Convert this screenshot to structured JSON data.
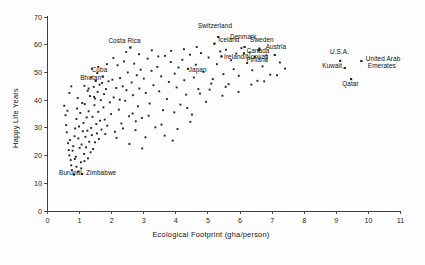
{
  "chart_data": {
    "type": "scatter",
    "title": "",
    "xlabel": "Ecological Footprint (gha/person)",
    "ylabel": "Happy Life Years",
    "xlim": [
      0,
      11
    ],
    "ylim": [
      0,
      70
    ],
    "xticks": [
      0,
      1,
      2,
      3,
      4,
      5,
      6,
      7,
      8,
      9,
      10,
      11
    ],
    "yticks": [
      0,
      10,
      20,
      30,
      40,
      50,
      60,
      70
    ],
    "grid": false,
    "legend": "none",
    "marker_color": "#232323",
    "axis_color": "#2b2b2b",
    "background_color": "#fdfdfd",
    "annotations": [
      {
        "label": "Costa Rica",
        "x": 2.58,
        "y": 59.0,
        "lx": 2.4,
        "ly": 60.6,
        "anchor": "middle"
      },
      {
        "label": "Cuba",
        "x": 1.72,
        "y": 48.5,
        "lx": 1.62,
        "ly": 50.1,
        "anchor": "middle"
      },
      {
        "label": "Bhutan",
        "x": 1.5,
        "y": 47.0,
        "lx": 1.02,
        "ly": 47.3,
        "anchor": "start"
      },
      {
        "label": "Burundi",
        "x": 0.82,
        "y": 13.2,
        "lx": 0.36,
        "ly": 12.9,
        "anchor": "start"
      },
      {
        "label": "Zimbabwe",
        "x": 1.08,
        "y": 13.4,
        "lx": 1.2,
        "ly": 12.9,
        "anchor": "start"
      },
      {
        "label": "Japan",
        "x": 4.38,
        "y": 51.3,
        "lx": 4.4,
        "ly": 50.3,
        "anchor": "start"
      },
      {
        "label": "Switzerland",
        "x": 5.32,
        "y": 62.8,
        "lx": 5.22,
        "ly": 65.9,
        "anchor": "middle"
      },
      {
        "label": "Iceland",
        "x": 5.2,
        "y": 60.4,
        "lx": 5.32,
        "ly": 60.8,
        "anchor": "start"
      },
      {
        "label": "Denmark",
        "x": 6.14,
        "y": 59.2,
        "lx": 6.1,
        "ly": 61.9,
        "anchor": "middle"
      },
      {
        "label": "Sweden",
        "x": 6.6,
        "y": 58.6,
        "lx": 6.68,
        "ly": 61.0,
        "anchor": "middle"
      },
      {
        "label": "Austria",
        "x": 7.08,
        "y": 56.3,
        "lx": 7.12,
        "ly": 58.6,
        "anchor": "middle"
      },
      {
        "label": "Canada",
        "x": 6.12,
        "y": 56.9,
        "lx": 6.2,
        "ly": 57.0,
        "anchor": "start"
      },
      {
        "label": "Finland",
        "x": 6.58,
        "y": 58.0,
        "lx": 6.54,
        "ly": 53.6,
        "anchor": "middle"
      },
      {
        "label": "Ireland/Norway",
        "x": 5.42,
        "y": 55.8,
        "lx": 5.5,
        "ly": 55.0,
        "anchor": "start"
      },
      {
        "label": "U.S.A.",
        "x": 9.12,
        "y": 54.2,
        "lx": 9.1,
        "ly": 56.8,
        "anchor": "middle"
      },
      {
        "label": "Kuwait",
        "x": 9.26,
        "y": 51.6,
        "lx": 9.18,
        "ly": 51.6,
        "anchor": "end"
      },
      {
        "label": "United Arab",
        "x": 9.78,
        "y": 54.1,
        "lx": 9.92,
        "ly": 54.2,
        "anchor": "start"
      },
      {
        "label": "Emerates",
        "x": null,
        "y": null,
        "lx": 9.98,
        "ly": 51.6,
        "anchor": "start"
      },
      {
        "label": "Qatar",
        "x": 9.46,
        "y": 47.6,
        "lx": 9.44,
        "ly": 45.2,
        "anchor": "middle"
      }
    ],
    "points": [
      [
        0.52,
        38.0
      ],
      [
        0.56,
        34.6
      ],
      [
        0.58,
        31.0
      ],
      [
        0.6,
        28.4
      ],
      [
        0.62,
        36.2
      ],
      [
        0.64,
        24.5
      ],
      [
        0.66,
        22.0
      ],
      [
        0.68,
        20.1
      ],
      [
        0.7,
        25.6
      ],
      [
        0.72,
        18.4
      ],
      [
        0.74,
        16.5
      ],
      [
        0.76,
        14.8
      ],
      [
        0.78,
        21.8
      ],
      [
        0.8,
        23.4
      ],
      [
        0.82,
        13.2
      ],
      [
        0.84,
        27.0
      ],
      [
        0.86,
        29.8
      ],
      [
        0.88,
        19.6
      ],
      [
        0.9,
        33.2
      ],
      [
        0.92,
        37.0
      ],
      [
        0.94,
        40.8
      ],
      [
        0.96,
        26.2
      ],
      [
        0.98,
        30.5
      ],
      [
        1.0,
        22.8
      ],
      [
        1.02,
        35.4
      ],
      [
        1.04,
        17.6
      ],
      [
        1.06,
        24.0
      ],
      [
        1.08,
        13.4
      ],
      [
        1.1,
        28.8
      ],
      [
        1.12,
        31.8
      ],
      [
        1.14,
        20.6
      ],
      [
        1.16,
        38.6
      ],
      [
        1.18,
        26.8
      ],
      [
        1.2,
        23.0
      ],
      [
        1.22,
        33.8
      ],
      [
        1.24,
        29.0
      ],
      [
        1.26,
        19.0
      ],
      [
        1.28,
        36.0
      ],
      [
        1.3,
        25.0
      ],
      [
        1.32,
        41.5
      ],
      [
        1.34,
        21.2
      ],
      [
        1.36,
        30.0
      ],
      [
        1.38,
        27.4
      ],
      [
        1.4,
        34.0
      ],
      [
        1.42,
        22.4
      ],
      [
        1.44,
        44.8
      ],
      [
        1.46,
        38.2
      ],
      [
        1.48,
        24.8
      ],
      [
        1.5,
        47.0
      ],
      [
        1.52,
        31.4
      ],
      [
        1.54,
        28.0
      ],
      [
        1.56,
        43.0
      ],
      [
        1.58,
        35.8
      ],
      [
        1.6,
        26.0
      ],
      [
        1.62,
        45.6
      ],
      [
        1.64,
        32.6
      ],
      [
        1.66,
        40.0
      ],
      [
        1.68,
        29.4
      ],
      [
        1.7,
        46.2
      ],
      [
        1.72,
        48.5
      ],
      [
        1.74,
        37.4
      ],
      [
        1.76,
        42.2
      ],
      [
        1.78,
        33.0
      ],
      [
        1.8,
        27.8
      ],
      [
        1.82,
        44.0
      ],
      [
        1.86,
        30.8
      ],
      [
        1.9,
        46.8
      ],
      [
        1.94,
        39.2
      ],
      [
        1.98,
        35.0
      ],
      [
        2.02,
        47.4
      ],
      [
        2.06,
        41.0
      ],
      [
        2.1,
        28.6
      ],
      [
        2.14,
        44.4
      ],
      [
        2.18,
        52.6
      ],
      [
        2.22,
        36.6
      ],
      [
        2.26,
        48.0
      ],
      [
        2.3,
        31.6
      ],
      [
        2.34,
        45.0
      ],
      [
        2.38,
        54.0
      ],
      [
        2.42,
        39.8
      ],
      [
        2.46,
        43.6
      ],
      [
        2.5,
        50.0
      ],
      [
        2.54,
        34.2
      ],
      [
        2.58,
        59.0
      ],
      [
        2.62,
        46.4
      ],
      [
        2.66,
        41.8
      ],
      [
        2.7,
        53.2
      ],
      [
        2.74,
        29.2
      ],
      [
        2.78,
        49.0
      ],
      [
        2.82,
        37.8
      ],
      [
        2.86,
        44.2
      ],
      [
        2.9,
        51.0
      ],
      [
        2.94,
        33.6
      ],
      [
        3.0,
        47.8
      ],
      [
        3.06,
        42.6
      ],
      [
        3.12,
        55.0
      ],
      [
        3.18,
        38.8
      ],
      [
        3.24,
        50.6
      ],
      [
        3.3,
        45.4
      ],
      [
        3.36,
        30.2
      ],
      [
        3.42,
        52.0
      ],
      [
        3.48,
        43.2
      ],
      [
        3.54,
        48.6
      ],
      [
        3.6,
        36.4
      ],
      [
        3.66,
        56.0
      ],
      [
        3.72,
        40.4
      ],
      [
        3.78,
        46.6
      ],
      [
        3.84,
        53.8
      ],
      [
        3.9,
        25.4
      ],
      [
        3.96,
        49.6
      ],
      [
        4.02,
        44.6
      ],
      [
        4.08,
        51.8
      ],
      [
        4.14,
        38.4
      ],
      [
        4.2,
        54.6
      ],
      [
        4.26,
        47.2
      ],
      [
        4.32,
        42.0
      ],
      [
        4.38,
        51.3
      ],
      [
        4.44,
        56.4
      ],
      [
        4.5,
        34.8
      ],
      [
        4.56,
        48.2
      ],
      [
        4.62,
        52.8
      ],
      [
        4.7,
        44.0
      ],
      [
        4.78,
        57.0
      ],
      [
        4.86,
        50.2
      ],
      [
        4.94,
        39.4
      ],
      [
        5.02,
        55.4
      ],
      [
        5.1,
        46.0
      ],
      [
        5.2,
        60.4
      ],
      [
        5.28,
        53.0
      ],
      [
        5.32,
        62.8
      ],
      [
        5.38,
        57.6
      ],
      [
        5.42,
        55.8
      ],
      [
        5.48,
        49.4
      ],
      [
        5.56,
        58.2
      ],
      [
        5.64,
        45.8
      ],
      [
        5.72,
        54.4
      ],
      [
        5.8,
        51.2
      ],
      [
        5.88,
        56.8
      ],
      [
        5.96,
        48.8
      ],
      [
        6.04,
        58.8
      ],
      [
        6.12,
        56.9
      ],
      [
        6.14,
        59.2
      ],
      [
        6.22,
        53.4
      ],
      [
        6.3,
        57.2
      ],
      [
        6.38,
        50.8
      ],
      [
        6.46,
        55.6
      ],
      [
        6.54,
        47.0
      ],
      [
        6.58,
        58.0
      ],
      [
        6.6,
        58.6
      ],
      [
        6.7,
        52.2
      ],
      [
        6.82,
        56.2
      ],
      [
        6.94,
        49.2
      ],
      [
        7.08,
        56.3
      ],
      [
        7.24,
        53.6
      ],
      [
        7.4,
        51.4
      ],
      [
        9.12,
        54.2
      ],
      [
        9.26,
        51.6
      ],
      [
        9.46,
        47.6
      ],
      [
        9.78,
        54.1
      ],
      [
        1.15,
        45.2
      ],
      [
        1.25,
        43.4
      ],
      [
        1.35,
        48.2
      ],
      [
        1.45,
        41.2
      ],
      [
        1.55,
        49.8
      ],
      [
        0.9,
        16.0
      ],
      [
        0.95,
        14.2
      ],
      [
        1.05,
        15.4
      ],
      [
        0.85,
        18.8
      ],
      [
        1.15,
        18.0
      ],
      [
        2.05,
        55.2
      ],
      [
        2.45,
        57.4
      ],
      [
        2.85,
        56.6
      ],
      [
        3.25,
        58.0
      ],
      [
        3.65,
        27.2
      ],
      [
        4.05,
        29.6
      ],
      [
        4.45,
        32.2
      ],
      [
        2.15,
        26.4
      ],
      [
        2.55,
        24.2
      ],
      [
        2.95,
        22.6
      ],
      [
        1.85,
        53.0
      ],
      [
        2.25,
        40.2
      ],
      [
        2.65,
        35.2
      ],
      [
        3.05,
        26.6
      ],
      [
        3.45,
        55.8
      ],
      [
        3.85,
        57.8
      ],
      [
        4.25,
        58.4
      ],
      [
        4.65,
        59.2
      ],
      [
        5.05,
        43.8
      ],
      [
        5.45,
        41.6
      ],
      [
        0.68,
        42.6
      ],
      [
        0.74,
        45.0
      ],
      [
        1.08,
        39.0
      ],
      [
        1.28,
        44.2
      ],
      [
        1.48,
        40.6
      ],
      [
        2.35,
        29.8
      ],
      [
        2.75,
        32.4
      ],
      [
        3.15,
        34.4
      ],
      [
        3.55,
        31.2
      ],
      [
        3.95,
        35.6
      ],
      [
        4.35,
        37.2
      ],
      [
        4.75,
        42.4
      ],
      [
        5.15,
        47.6
      ],
      [
        5.55,
        44.8
      ],
      [
        5.95,
        43.0
      ],
      [
        6.35,
        45.6
      ],
      [
        6.75,
        46.8
      ],
      [
        7.15,
        49.0
      ],
      [
        1.38,
        51.4
      ],
      [
        1.58,
        52.0
      ]
    ]
  }
}
